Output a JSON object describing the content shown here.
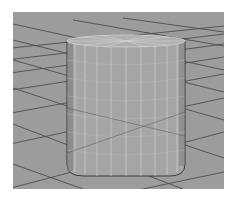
{
  "viewport": {
    "type": "3d-perspective-viewport",
    "background_color": "#9c9c9c",
    "grid_line_color": "#4a4a4a",
    "object": {
      "type": "cylinder",
      "display": "wireframe-on-shaded",
      "fill_color": "#a3a3a3",
      "wire_color": "#d6d6d6",
      "selected": true
    }
  }
}
